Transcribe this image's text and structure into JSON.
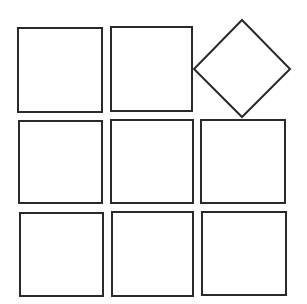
{
  "diagram": {
    "stroke_color": "#2a2a2a",
    "background": "#ffffff",
    "squares": [
      {
        "row": 1,
        "col": 1,
        "x": 17,
        "y": 27,
        "w": 86,
        "h": 86,
        "rotated": false
      },
      {
        "row": 1,
        "col": 2,
        "x": 110,
        "y": 26,
        "w": 83,
        "h": 86,
        "rotated": false
      },
      {
        "row": 1,
        "col": 3,
        "cx": 242,
        "cy": 69,
        "half_diag": 48,
        "rotated": true
      },
      {
        "row": 2,
        "col": 1,
        "x": 18,
        "y": 120,
        "w": 85,
        "h": 84,
        "rotated": false
      },
      {
        "row": 2,
        "col": 2,
        "x": 110,
        "y": 119,
        "w": 84,
        "h": 85,
        "rotated": false
      },
      {
        "row": 2,
        "col": 3,
        "x": 200,
        "y": 119,
        "w": 86,
        "h": 85,
        "rotated": false
      },
      {
        "row": 3,
        "col": 1,
        "x": 19,
        "y": 212,
        "w": 85,
        "h": 85,
        "rotated": false
      },
      {
        "row": 3,
        "col": 2,
        "x": 111,
        "y": 211,
        "w": 83,
        "h": 86,
        "rotated": false
      },
      {
        "row": 3,
        "col": 3,
        "x": 201,
        "y": 211,
        "w": 86,
        "h": 85,
        "rotated": false
      }
    ]
  }
}
